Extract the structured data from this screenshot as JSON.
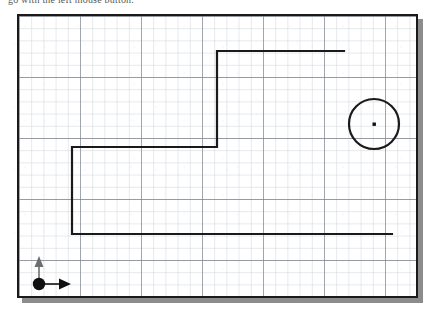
{
  "caption": {
    "text": "go with the left mouse button."
  },
  "window": {
    "name": "drawing-canvas-window",
    "frame_color": "#1a1a1a",
    "shadow_color": "#8c8c8c",
    "background": "#ffffff",
    "width": 401,
    "height": 284
  },
  "grid": {
    "minor_spacing": 12.2,
    "major_spacing": 61,
    "minor_color": "#c9cfd8",
    "major_color": "#7b818c",
    "visible": true
  },
  "origin_indicator": {
    "name": "origin-marker",
    "x": 20,
    "y": 270,
    "dot_color": "#101010",
    "dot_radius": 6,
    "x_axis_label": "x-axis-arrow",
    "y_axis_label": "y-axis-arrow",
    "arrow_color": "#101010",
    "y_arrow_color": "#6e6e6e"
  },
  "shapes": [
    {
      "name": "stepped-polyline",
      "type": "polyline",
      "stroke": "#1a1a1a",
      "stroke_width": 2.2,
      "points": "325,35 198,35 198,131 53,131 53,218 373,218"
    },
    {
      "name": "circle-shape",
      "type": "circle",
      "stroke": "#1a1a1a",
      "stroke_width": 2.2,
      "fill": "none",
      "cx": 355,
      "cy": 108,
      "r": 25
    },
    {
      "name": "circle-center-point",
      "type": "point",
      "fill": "#101010",
      "cx": 355,
      "cy": 108,
      "size": 3
    }
  ],
  "colors": {
    "ink": "#1a1a1a",
    "grid_minor": "#c9cfd8",
    "grid_major": "#7b818c",
    "paper": "#ffffff",
    "shadow": "#8c8c8c"
  }
}
